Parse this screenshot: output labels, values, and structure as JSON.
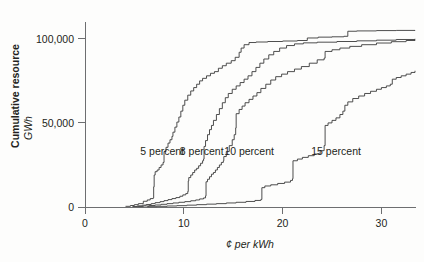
{
  "chart_data": {
    "type": "line",
    "title": "",
    "xlabel": "¢ per kWh",
    "ylabel_main": "Cumulative resource",
    "ylabel_unit": "GWh",
    "xlim": [
      0,
      33.5
    ],
    "ylim": [
      0,
      110000
    ],
    "grid": false,
    "legend_position": "inline-annotations",
    "xticks": [
      0,
      10,
      20,
      30
    ],
    "xtick_labels": [
      "0",
      "10",
      "20",
      "30"
    ],
    "yticks": [
      0,
      50000,
      100000
    ],
    "ytick_labels": [
      "0",
      "50,000",
      "100,000"
    ],
    "annotations": [
      {
        "text": "5 percent",
        "x": 5.6,
        "y": 31000
      },
      {
        "text": "8 percent",
        "x": 9.6,
        "y": 31000
      },
      {
        "text": "10 percent",
        "x": 14.1,
        "y": 31000
      },
      {
        "text": "15 percent",
        "x": 22.9,
        "y": 31000
      }
    ],
    "series": [
      {
        "name": "5 percent",
        "label": "5 percent",
        "color": "#3a3a3a",
        "points": [
          [
            4.1,
            400
          ],
          [
            4.6,
            900
          ],
          [
            5.0,
            1400
          ],
          [
            5.4,
            2000
          ],
          [
            5.9,
            3400
          ],
          [
            6.3,
            4200
          ],
          [
            6.6,
            5000
          ],
          [
            6.9,
            5400
          ],
          [
            6.95,
            12000
          ],
          [
            7.0,
            19000
          ],
          [
            7.1,
            21000
          ],
          [
            7.3,
            22000
          ],
          [
            7.5,
            23500
          ],
          [
            7.7,
            25000
          ],
          [
            7.9,
            26500
          ],
          [
            8.0,
            27500
          ],
          [
            8.0,
            33000
          ],
          [
            8.2,
            35500
          ],
          [
            8.4,
            38000
          ],
          [
            8.6,
            40000
          ],
          [
            8.8,
            42000
          ],
          [
            8.9,
            44500
          ],
          [
            9.1,
            47500
          ],
          [
            9.3,
            50500
          ],
          [
            9.5,
            53500
          ],
          [
            9.7,
            57000
          ],
          [
            9.9,
            60500
          ],
          [
            10.1,
            63500
          ],
          [
            10.4,
            66500
          ],
          [
            10.7,
            69000
          ],
          [
            11.0,
            71000
          ],
          [
            11.3,
            73000
          ],
          [
            11.6,
            75000
          ],
          [
            11.9,
            76500
          ],
          [
            12.3,
            78000
          ],
          [
            12.7,
            79500
          ],
          [
            13.1,
            80500
          ],
          [
            13.5,
            82500
          ],
          [
            13.9,
            84000
          ],
          [
            14.3,
            85500
          ],
          [
            14.8,
            87000
          ],
          [
            15.2,
            89000
          ],
          [
            15.6,
            92000
          ],
          [
            15.8,
            94500
          ],
          [
            16.1,
            96500
          ],
          [
            16.6,
            97800
          ],
          [
            17.3,
            98100
          ],
          [
            18.5,
            98400
          ],
          [
            20.0,
            98700
          ],
          [
            21.5,
            99000
          ],
          [
            22.5,
            100500
          ],
          [
            23.6,
            101000
          ],
          [
            25.0,
            101200
          ],
          [
            26.2,
            101500
          ],
          [
            26.6,
            104500
          ],
          [
            27.5,
            104700
          ],
          [
            29.5,
            104900
          ],
          [
            31.5,
            105000
          ],
          [
            33.4,
            105200
          ]
        ]
      },
      {
        "name": "8 percent",
        "label": "8 percent",
        "color": "#3a3a3a",
        "points": [
          [
            4.8,
            300
          ],
          [
            5.3,
            700
          ],
          [
            5.8,
            1100
          ],
          [
            6.2,
            1500
          ],
          [
            6.7,
            2000
          ],
          [
            7.1,
            2600
          ],
          [
            7.6,
            3200
          ],
          [
            8.0,
            3800
          ],
          [
            8.4,
            4400
          ],
          [
            8.8,
            5000
          ],
          [
            9.2,
            5600
          ],
          [
            9.6,
            6400
          ],
          [
            9.9,
            7200
          ],
          [
            10.2,
            8000
          ],
          [
            10.4,
            9200
          ],
          [
            10.45,
            15500
          ],
          [
            10.5,
            17500
          ],
          [
            10.7,
            19000
          ],
          [
            10.9,
            20500
          ],
          [
            11.1,
            22000
          ],
          [
            11.3,
            23000
          ],
          [
            11.5,
            24500
          ],
          [
            11.7,
            26000
          ],
          [
            11.9,
            27500
          ],
          [
            12.0,
            28500
          ],
          [
            12.05,
            36000
          ],
          [
            12.2,
            39500
          ],
          [
            12.4,
            43000
          ],
          [
            12.6,
            46000
          ],
          [
            12.8,
            48500
          ],
          [
            13.0,
            51500
          ],
          [
            13.3,
            55000
          ],
          [
            13.6,
            58500
          ],
          [
            13.9,
            62000
          ],
          [
            14.2,
            65000
          ],
          [
            14.5,
            67500
          ],
          [
            14.9,
            70000
          ],
          [
            15.3,
            72000
          ],
          [
            15.7,
            74000
          ],
          [
            16.1,
            76000
          ],
          [
            16.5,
            78000
          ],
          [
            16.9,
            80500
          ],
          [
            17.3,
            83000
          ],
          [
            17.7,
            85500
          ],
          [
            18.1,
            88000
          ],
          [
            18.6,
            90500
          ],
          [
            19.1,
            92500
          ],
          [
            19.7,
            94500
          ],
          [
            20.4,
            96000
          ],
          [
            21.2,
            97000
          ],
          [
            22.1,
            97600
          ],
          [
            23.5,
            98000
          ],
          [
            25.5,
            98400
          ],
          [
            27.5,
            98800
          ],
          [
            29.5,
            99200
          ],
          [
            31.5,
            99600
          ],
          [
            33.4,
            100000
          ]
        ]
      },
      {
        "name": "10 percent",
        "label": "10 percent",
        "color": "#3a3a3a",
        "points": [
          [
            5.3,
            250
          ],
          [
            5.9,
            600
          ],
          [
            6.5,
            900
          ],
          [
            7.1,
            1200
          ],
          [
            7.7,
            1600
          ],
          [
            8.3,
            2000
          ],
          [
            8.9,
            2400
          ],
          [
            9.5,
            2800
          ],
          [
            10.1,
            3200
          ],
          [
            10.7,
            3700
          ],
          [
            11.2,
            4200
          ],
          [
            11.6,
            4800
          ],
          [
            12.0,
            5400
          ],
          [
            12.2,
            6600
          ],
          [
            12.25,
            15000
          ],
          [
            12.4,
            16500
          ],
          [
            12.6,
            18000
          ],
          [
            12.8,
            19500
          ],
          [
            13.0,
            20500
          ],
          [
            13.2,
            22000
          ],
          [
            13.4,
            23500
          ],
          [
            13.6,
            25000
          ],
          [
            13.8,
            26500
          ],
          [
            14.0,
            27500
          ],
          [
            14.05,
            30000
          ],
          [
            14.3,
            33000
          ],
          [
            14.6,
            36500
          ],
          [
            14.9,
            40000
          ],
          [
            15.1,
            43000
          ],
          [
            15.25,
            47000
          ],
          [
            15.3,
            55500
          ],
          [
            15.6,
            58000
          ],
          [
            15.9,
            60000
          ],
          [
            16.2,
            62000
          ],
          [
            16.6,
            64000
          ],
          [
            17.0,
            66000
          ],
          [
            17.4,
            68000
          ],
          [
            17.8,
            70500
          ],
          [
            18.3,
            73000
          ],
          [
            18.8,
            75500
          ],
          [
            19.3,
            77500
          ],
          [
            19.9,
            79000
          ],
          [
            20.5,
            80500
          ],
          [
            21.2,
            82000
          ],
          [
            21.9,
            83500
          ],
          [
            22.7,
            85500
          ],
          [
            23.5,
            87500
          ],
          [
            24.2,
            88500
          ],
          [
            24.3,
            92500
          ],
          [
            25.0,
            93500
          ],
          [
            25.8,
            94500
          ],
          [
            26.8,
            95500
          ],
          [
            28.0,
            96500
          ],
          [
            29.5,
            97500
          ],
          [
            31.0,
            98300
          ],
          [
            32.5,
            99000
          ],
          [
            33.4,
            99400
          ]
        ]
      },
      {
        "name": "15 percent",
        "label": "15 percent",
        "color": "#3a3a3a",
        "points": [
          [
            6.3,
            200
          ],
          [
            7.3,
            400
          ],
          [
            8.3,
            600
          ],
          [
            9.3,
            800
          ],
          [
            10.3,
            1100
          ],
          [
            11.3,
            1400
          ],
          [
            12.3,
            1700
          ],
          [
            13.3,
            2000
          ],
          [
            14.3,
            2400
          ],
          [
            15.3,
            2800
          ],
          [
            16.3,
            3300
          ],
          [
            17.2,
            3900
          ],
          [
            17.8,
            4500
          ],
          [
            17.9,
            11500
          ],
          [
            18.2,
            12500
          ],
          [
            18.8,
            13200
          ],
          [
            19.5,
            14000
          ],
          [
            20.2,
            14800
          ],
          [
            20.8,
            15800
          ],
          [
            21.0,
            16800
          ],
          [
            21.05,
            27500
          ],
          [
            21.5,
            28500
          ],
          [
            22.0,
            29500
          ],
          [
            22.6,
            30500
          ],
          [
            23.2,
            31500
          ],
          [
            23.8,
            33500
          ],
          [
            24.2,
            36500
          ],
          [
            24.3,
            48500
          ],
          [
            24.6,
            50000
          ],
          [
            25.0,
            51500
          ],
          [
            25.4,
            53000
          ],
          [
            25.8,
            55000
          ],
          [
            26.1,
            57000
          ],
          [
            26.3,
            60500
          ],
          [
            26.6,
            62500
          ],
          [
            27.1,
            64500
          ],
          [
            27.7,
            66000
          ],
          [
            28.3,
            67500
          ],
          [
            28.9,
            68800
          ],
          [
            29.5,
            70000
          ],
          [
            30.0,
            71000
          ],
          [
            30.5,
            72000
          ],
          [
            30.9,
            73000
          ],
          [
            31.1,
            76000
          ],
          [
            31.5,
            77000
          ],
          [
            32.0,
            78000
          ],
          [
            32.5,
            79000
          ],
          [
            33.0,
            80000
          ],
          [
            33.4,
            81000
          ]
        ]
      }
    ]
  }
}
